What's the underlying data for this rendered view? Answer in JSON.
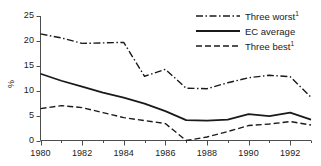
{
  "chart_data": {
    "type": "line",
    "title": "",
    "subtitle": "",
    "xlabel": "",
    "ylabel": "%",
    "xlim": [
      1980,
      1993
    ],
    "ylim": [
      0,
      25
    ],
    "grid": false,
    "legend_position": "top-right",
    "x": [
      1980,
      1981,
      1982,
      1983,
      1984,
      1985,
      1986,
      1987,
      1988,
      1989,
      1990,
      1991,
      1992,
      1993
    ],
    "xticks": [
      1980,
      1982,
      1984,
      1986,
      1988,
      1990,
      1992
    ],
    "xtick_labels": [
      "1980",
      "1982",
      "1984",
      "1986",
      "1988",
      "1990",
      "1992"
    ],
    "xminor_ticks": [
      1981,
      1983,
      1985,
      1987,
      1989,
      1991,
      1993
    ],
    "yticks": [
      0,
      5,
      10,
      15,
      20,
      25
    ],
    "ytick_labels": [
      "0",
      "5",
      "10",
      "15",
      "20",
      "25"
    ],
    "series": [
      {
        "name": "Three worst",
        "footnote": "1",
        "style": "dash-dot",
        "color": "#1a1a1a",
        "values": [
          21.4,
          20.6,
          19.5,
          19.6,
          19.7,
          12.9,
          14.3,
          10.5,
          10.4,
          11.6,
          12.6,
          13.1,
          12.8,
          8.7
        ]
      },
      {
        "name": "EC average",
        "footnote": "",
        "style": "solid",
        "color": "#1a1a1a",
        "values": [
          13.4,
          12.0,
          10.8,
          9.6,
          8.6,
          7.4,
          5.9,
          4.1,
          4.0,
          4.2,
          5.3,
          4.9,
          5.6,
          4.2
        ]
      },
      {
        "name": "Three best",
        "footnote": "1",
        "style": "dashed",
        "color": "#1a1a1a",
        "values": [
          6.4,
          7.0,
          6.6,
          5.6,
          4.6,
          4.0,
          3.4,
          0.0,
          0.7,
          1.8,
          3.0,
          3.3,
          3.8,
          3.1
        ]
      }
    ]
  },
  "legend": {
    "items": [
      {
        "label": "Three worst",
        "footnote": "1",
        "style": "dash-dot"
      },
      {
        "label": "EC average",
        "footnote": "",
        "style": "solid"
      },
      {
        "label": "Three best",
        "footnote": "1",
        "style": "dashed"
      }
    ]
  },
  "colors": {
    "ink": "#1a1a1a",
    "axis": "#4d4d4d",
    "background": "#ffffff"
  }
}
